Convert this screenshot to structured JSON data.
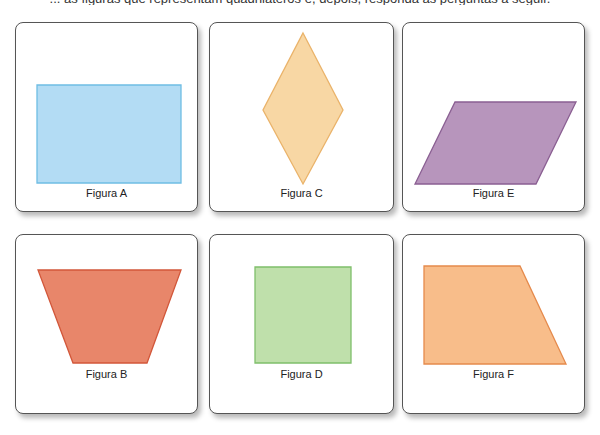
{
  "header": {
    "cut_off_text": "... as figuras que representam quadriláteros e, depois, responda às perguntas a seguir."
  },
  "cards": [
    {
      "id": "A",
      "label": "Figura A",
      "shape": "rectangle",
      "fill": "#b3dcf4",
      "stroke": "#6fbde4",
      "box": {
        "x": 15,
        "y": 22,
        "w": 183,
        "h": 190
      },
      "points": "21,62 165,62 165,160 21,160",
      "label_y": 164
    },
    {
      "id": "C",
      "label": "Figura C",
      "shape": "rhombus",
      "fill": "#f8d7a4",
      "stroke": "#eab36a",
      "box": {
        "x": 209,
        "y": 22,
        "w": 185,
        "h": 190
      },
      "points": "93,10 133,87 93,161 53,87",
      "label_y": 164
    },
    {
      "id": "E",
      "label": "Figura E",
      "shape": "parallelogram",
      "fill": "#b795bc",
      "stroke": "#8a5f92",
      "box": {
        "x": 402,
        "y": 22,
        "w": 183,
        "h": 190
      },
      "points": "52,79 173,79 133,161 12,161",
      "label_y": 164
    },
    {
      "id": "B",
      "label": "Figura B",
      "shape": "isosceles-trapezoid",
      "fill": "#e8866a",
      "stroke": "#d2573a",
      "box": {
        "x": 15,
        "y": 234,
        "w": 183,
        "h": 180
      },
      "points": "22,35 165,35 131,128 57,128",
      "label_y": 133
    },
    {
      "id": "D",
      "label": "Figura D",
      "shape": "square",
      "fill": "#bfe0ab",
      "stroke": "#7fbf6b",
      "box": {
        "x": 209,
        "y": 234,
        "w": 185,
        "h": 180
      },
      "points": "45,32 141,32 141,128 45,128",
      "label_y": 133
    },
    {
      "id": "F",
      "label": "Figura F",
      "shape": "right-trapezoid",
      "fill": "#f8bd8a",
      "stroke": "#e58a4c",
      "box": {
        "x": 402,
        "y": 234,
        "w": 183,
        "h": 180
      },
      "points": "21,31 117,31 163,129 21,129",
      "label_y": 133
    }
  ]
}
